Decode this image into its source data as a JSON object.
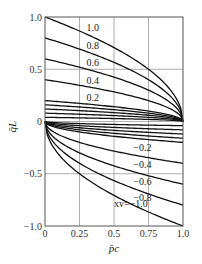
{
  "chart_data": {
    "type": "line",
    "title": "",
    "xlabel": "p̄c",
    "ylabel": "q̄L",
    "xlim": [
      0,
      1.0
    ],
    "ylim": [
      -1.0,
      1.0
    ],
    "grid": true,
    "x_ticks": [
      "0",
      "0.25",
      "0.5",
      "0.75",
      "1.0"
    ],
    "x_tick_values": [
      0,
      0.25,
      0.5,
      0.75,
      1.0
    ],
    "y_ticks": [
      "1.0",
      "0.5",
      "0",
      "−0.5",
      "−1.0"
    ],
    "y_tick_values": [
      1.0,
      0.5,
      0,
      -0.5,
      -1.0
    ],
    "parameter_name": "xv",
    "relation": "positive xv: qL = xv·sqrt(1 − pc); negative xv: qL = xv·sqrt(pc)",
    "series": [
      {
        "name": "xv=1.0",
        "xv": 1.0,
        "label": "1.0"
      },
      {
        "name": "xv=0.8",
        "xv": 0.8,
        "label": "0.8"
      },
      {
        "name": "xv=0.6",
        "xv": 0.6,
        "label": "0.6"
      },
      {
        "name": "xv=0.4",
        "xv": 0.4,
        "label": "0.4"
      },
      {
        "name": "xv=0.2",
        "xv": 0.2,
        "label": "0.2"
      },
      {
        "name": "xv=0.16",
        "xv": 0.16,
        "label": ""
      },
      {
        "name": "xv=0.12",
        "xv": 0.12,
        "label": ""
      },
      {
        "name": "xv=0.08",
        "xv": 0.08,
        "label": ""
      },
      {
        "name": "xv=0.04",
        "xv": 0.04,
        "label": ""
      },
      {
        "name": "xv=-0.04",
        "xv": -0.04,
        "label": ""
      },
      {
        "name": "xv=-0.08",
        "xv": -0.08,
        "label": ""
      },
      {
        "name": "xv=-0.12",
        "xv": -0.12,
        "label": ""
      },
      {
        "name": "xv=-0.16",
        "xv": -0.16,
        "label": ""
      },
      {
        "name": "xv=-0.2",
        "xv": -0.2,
        "label": "−0.2"
      },
      {
        "name": "xv=-0.4",
        "xv": -0.4,
        "label": "−0.4"
      },
      {
        "name": "xv=-0.6",
        "xv": -0.6,
        "label": "−0.6"
      },
      {
        "name": "xv=-0.8",
        "xv": -0.8,
        "label": "−0.8"
      },
      {
        "name": "xv=-1.0",
        "xv": -1.0,
        "label": "xv=−1.0"
      }
    ],
    "sample_points": {
      "x": [
        0,
        0.25,
        0.5,
        0.75,
        1.0
      ],
      "xv=1.0": [
        1.0,
        0.866,
        0.707,
        0.5,
        0
      ],
      "xv=-1.0": [
        0,
        -0.5,
        -0.707,
        -0.866,
        -1.0
      ]
    },
    "legend": "inline labels on curves"
  }
}
